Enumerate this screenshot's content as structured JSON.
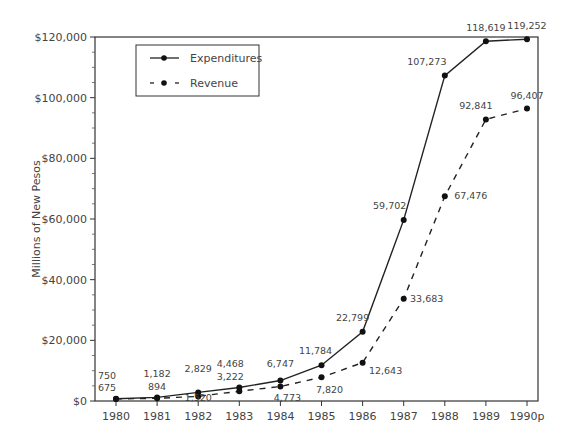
{
  "chart_data": {
    "type": "line",
    "title": "",
    "xlabel": "",
    "ylabel": "Millions of New Pesos",
    "categories": [
      "1980",
      "1981",
      "1982",
      "1983",
      "1984",
      "1985",
      "1986",
      "1987",
      "1988",
      "1989",
      "1990p"
    ],
    "ylim": [
      0,
      120000
    ],
    "yticks": [
      "$0",
      "$20,000",
      "$40,000",
      "$60,000",
      "$80,000",
      "$100,000",
      "$120,000"
    ],
    "grid": false,
    "legend_position": "upper-left",
    "series": [
      {
        "name": "Expenditures",
        "style": "solid",
        "values": [
          750,
          1182,
          2829,
          4468,
          6747,
          11784,
          22799,
          59702,
          107273,
          118619,
          119252
        ],
        "labels": [
          "750",
          "1,182",
          "2,829",
          "4,468",
          "6,747",
          "11,784",
          "22,799",
          "59,702",
          "107,273",
          "118,619",
          "119,252"
        ]
      },
      {
        "name": "Revenue",
        "style": "dashed",
        "values": [
          675,
          894,
          1520,
          3222,
          4773,
          7820,
          12643,
          33683,
          67476,
          92841,
          96407
        ],
        "labels": [
          "675",
          "894",
          "1,520",
          "3,222",
          "4,773",
          "7,820",
          "12,643",
          "33,683",
          "67,476",
          "92,841",
          "96,407"
        ]
      }
    ]
  }
}
